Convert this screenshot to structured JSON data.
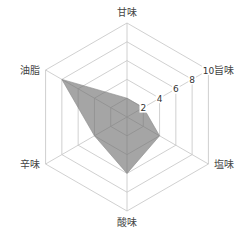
{
  "chart_data": {
    "type": "radar",
    "title": "",
    "categories": [
      "甘味",
      "旨味",
      "塩味",
      "酸味",
      "辛味",
      "油脂"
    ],
    "series": [
      {
        "name": "",
        "values": [
          2,
          2,
          4,
          6,
          4,
          8
        ],
        "color": "#6e6e6e"
      }
    ],
    "r_range": [
      0,
      10
    ],
    "r_ticks": [
      "2",
      "4",
      "6",
      "8",
      "10"
    ],
    "tick_axis": "旨味",
    "grid": true,
    "legend": null
  },
  "style": {
    "grid_color": "#c4c4c4",
    "fill_color": "#6e6e6e",
    "label_color": "#444444"
  }
}
